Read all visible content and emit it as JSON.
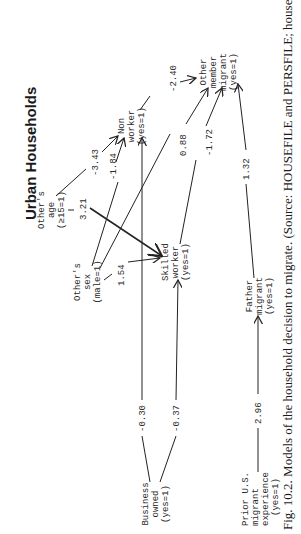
{
  "title": "Urban Households",
  "nodes": {
    "others_age": {
      "lines": [
        "Other's",
        "age",
        "(≥15=1)"
      ]
    },
    "others_sex": {
      "lines": [
        "Other's",
        "sex",
        "(male=1)"
      ]
    },
    "non_worker": {
      "lines": [
        "Non",
        "worker",
        "(yes=1)"
      ]
    },
    "skilled_worker": {
      "lines": [
        "Skilled",
        "worker",
        "(yes=1)"
      ]
    },
    "other_member_migrant": {
      "lines": [
        "Other",
        "member",
        "migrant",
        "(yes=1)"
      ]
    },
    "business_owned": {
      "lines": [
        "Business",
        "owned",
        "(yes=1)"
      ]
    },
    "father_migrant": {
      "lines": [
        "Father",
        "migrant",
        "(yes=1)"
      ]
    },
    "prior_us_migrant": {
      "lines": [
        "Prior U.S.",
        "migrant",
        "experience",
        "(yes=1)"
      ]
    }
  },
  "edges": [
    {
      "from": "others_age",
      "to": "non_worker",
      "coef": "-3.43"
    },
    {
      "from": "others_age",
      "to": "skilled_worker",
      "coef": "3.21"
    },
    {
      "from": "others_sex",
      "to": "non_worker",
      "coef": "-1.84"
    },
    {
      "from": "others_sex",
      "to": "skilled_worker",
      "coef": "1.54"
    },
    {
      "from": "non_worker",
      "to": "other_member_migrant",
      "coef": "-2.40"
    },
    {
      "from": "others_sex",
      "to": "other_member_migrant",
      "coef": "0.88"
    },
    {
      "from": "skilled_worker",
      "to": "other_member_migrant",
      "coef": "-1.72"
    },
    {
      "from": "business_owned",
      "to": "non_worker",
      "coef": "-0.30"
    },
    {
      "from": "business_owned",
      "to": "skilled_worker",
      "coef": "-0.37"
    },
    {
      "from": "father_migrant",
      "to": "other_member_migrant",
      "coef": "1.32"
    },
    {
      "from": "prior_us_migrant",
      "to": "father_migrant",
      "coef": "2.96"
    }
  ],
  "caption": "Fig. 10.2. Models of the household decision to migrate. (Source: HOUSEFILE and PERSFILE; household"
}
